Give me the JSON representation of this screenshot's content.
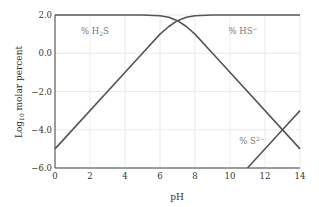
{
  "chart_data": {
    "type": "line",
    "title": "",
    "xlabel": "pH",
    "ylabel": "Log10 molar percent",
    "ylabel_main": "Log",
    "ylabel_sub": "10",
    "ylabel_rest": " molar percent",
    "xlim": [
      0,
      14
    ],
    "ylim": [
      -6.0,
      2.0
    ],
    "grid": true,
    "legend": "none (inline annotations)",
    "x_ticks": [
      0,
      2,
      4,
      6,
      8,
      10,
      12,
      14
    ],
    "x_tick_labels": [
      "0",
      "2",
      "4",
      "6",
      "8",
      "10",
      "12",
      "14"
    ],
    "y_ticks": [
      2.0,
      0.0,
      -2.0,
      -4.0,
      -6.0
    ],
    "y_tick_labels": [
      "2.0",
      "0.0",
      "−2.0",
      "−4.0",
      "−6.0"
    ],
    "series": [
      {
        "name": "% H2S",
        "x": [
          0,
          5,
          6,
          6.5,
          7,
          7.5,
          8,
          9,
          14
        ],
        "y": [
          2.0,
          2.0,
          1.96,
          1.88,
          1.7,
          1.4,
          1.0,
          0.0,
          -5.0
        ]
      },
      {
        "name": "% HS−",
        "x": [
          0,
          5,
          6,
          6.5,
          7,
          7.5,
          8,
          9,
          14
        ],
        "y": [
          -5.0,
          0.0,
          1.0,
          1.4,
          1.7,
          1.88,
          1.96,
          2.0,
          2.0
        ]
      },
      {
        "name": "% S2−",
        "x": [
          11,
          13,
          14
        ],
        "y": [
          -6.0,
          -4.0,
          -3.0
        ]
      }
    ],
    "annotations": [
      {
        "text_main": "% H",
        "text_sub": "2",
        "text_rest": "S",
        "x": 2.3,
        "y": 1.2
      },
      {
        "text_main": "% HS",
        "text_sup": "−",
        "x": 10.5,
        "y": 1.2
      },
      {
        "text_main": "% S",
        "text_sup": "2−",
        "x": 10.5,
        "y": -4.8
      }
    ]
  },
  "colors": {
    "line": "#555555",
    "grid": "#e6e6e6",
    "axis": "#444444",
    "annotation": "#777777"
  }
}
